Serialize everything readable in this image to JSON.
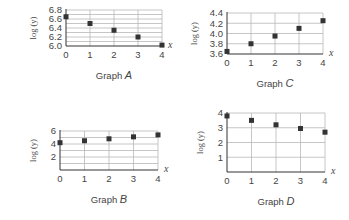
{
  "chart_data": [
    {
      "id": "A",
      "type": "scatter",
      "title": "Graph A",
      "title_prefix": "Graph",
      "title_letter": "A",
      "xlabel": "x",
      "ylabel": "log (y)",
      "x": [
        0,
        1,
        2,
        3,
        4
      ],
      "values": [
        6.65,
        6.5,
        6.35,
        6.2,
        6.02
      ],
      "xticks": [
        "0",
        "1",
        "2",
        "3",
        "4"
      ],
      "yticks": [
        "6.0",
        "6.2",
        "6.4",
        "6.6",
        "6.8"
      ],
      "ylim": [
        6.0,
        6.8
      ],
      "xlim": [
        0,
        4
      ],
      "grid": true,
      "layout": {
        "x0": 66,
        "x1": 162,
        "ytop": 10,
        "ybot": 46,
        "ygrid_step": 0.1,
        "ytick_step": 0.2
      }
    },
    {
      "id": "C",
      "type": "scatter",
      "title": "Graph C",
      "title_prefix": "Graph",
      "title_letter": "C",
      "xlabel": "x",
      "ylabel": "log (y)",
      "x": [
        0,
        1,
        2,
        3,
        4
      ],
      "values": [
        3.65,
        3.8,
        3.95,
        4.1,
        4.25
      ],
      "xticks": [
        "0",
        "1",
        "2",
        "3",
        "4"
      ],
      "yticks": [
        "3.6",
        "3.8",
        "4.0",
        "4.2",
        "4.4"
      ],
      "ylim": [
        3.6,
        4.4
      ],
      "xlim": [
        0,
        4
      ],
      "grid": true,
      "layout": {
        "x0": 227,
        "x1": 323,
        "ytop": 13,
        "ybot": 54,
        "ygrid_step": 0.2,
        "ytick_step": 0.2
      }
    },
    {
      "id": "B",
      "type": "scatter",
      "title": "Graph B",
      "title_prefix": "Graph",
      "title_letter": "B",
      "xlabel": "x",
      "ylabel": "log (y)",
      "x": [
        0,
        1,
        2,
        3,
        4
      ],
      "values": [
        4.2,
        4.5,
        4.8,
        5.1,
        5.4
      ],
      "xticks": [
        "0",
        "1",
        "2",
        "3",
        "4"
      ],
      "yticks": [
        "2",
        "4",
        "6"
      ],
      "ylim": [
        0,
        6
      ],
      "xlim": [
        0,
        4
      ],
      "grid": true,
      "layout": {
        "x0": 60,
        "x1": 158,
        "ytop": 131,
        "ybot": 170,
        "ygrid_step": 1,
        "ytick_step": 2
      }
    },
    {
      "id": "D",
      "type": "scatter",
      "title": "Graph D",
      "title_prefix": "Graph",
      "title_letter": "D",
      "xlabel": "x",
      "ylabel": "log (y)",
      "x": [
        0,
        1,
        2,
        3,
        4
      ],
      "values": [
        3.8,
        3.5,
        3.2,
        2.95,
        2.7
      ],
      "xticks": [
        "0",
        "1",
        "2",
        "3",
        "4"
      ],
      "yticks": [
        "1",
        "2",
        "3",
        "4"
      ],
      "ylim": [
        0,
        4
      ],
      "xlim": [
        0,
        4
      ],
      "grid": true,
      "layout": {
        "x0": 227,
        "x1": 325,
        "ytop": 113,
        "ybot": 172,
        "ygrid_step": 1,
        "ytick_step": 1
      }
    }
  ]
}
